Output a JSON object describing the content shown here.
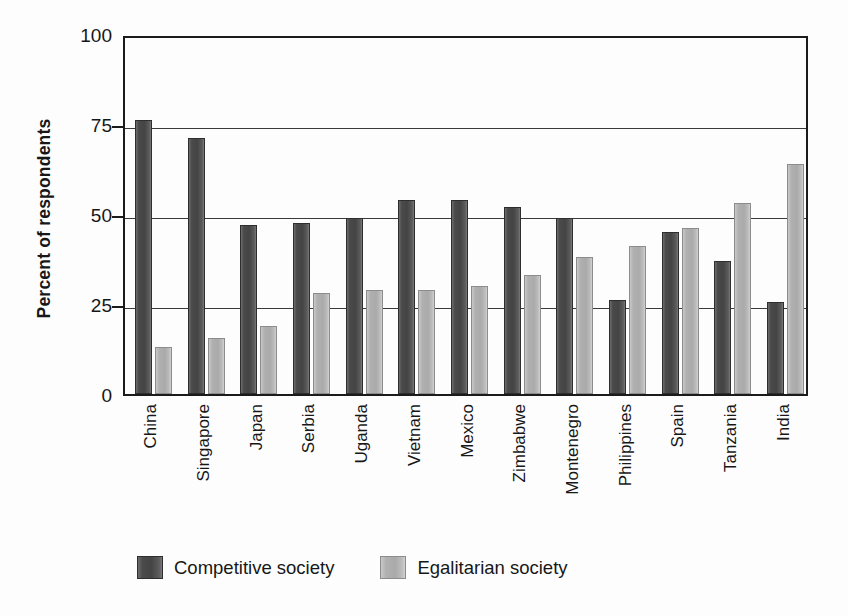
{
  "chart_data": {
    "type": "bar",
    "title": "",
    "xlabel": "",
    "ylabel": "Percent of respondents",
    "ylim": [
      0,
      100
    ],
    "yticks": [
      0,
      25,
      50,
      75,
      100
    ],
    "ytick_labels": [
      "0",
      "25",
      "50",
      "75",
      "100"
    ],
    "grid": "horizontal",
    "legend_position": "bottom",
    "categories": [
      "China",
      "Singapore",
      "Japan",
      "Serbia",
      "Uganda",
      "Vietnam",
      "Mexico",
      "Zimbabwe",
      "Montenegro",
      "Philippines",
      "Spain",
      "Tanzania",
      "India"
    ],
    "series": [
      {
        "name": "Competitive society",
        "color": "#4a4a4a",
        "values": [
          76,
          71,
          47,
          47.5,
          49,
          54,
          54,
          52,
          49,
          26,
          45,
          37,
          25.5
        ]
      },
      {
        "name": "Egalitarian society",
        "color": "#b0b0b0",
        "values": [
          13,
          15.5,
          19,
          28,
          29,
          29,
          30,
          33,
          38,
          41,
          46,
          53,
          64
        ]
      }
    ]
  },
  "legend": {
    "items": [
      {
        "label": "Competitive society",
        "swatch": "dark"
      },
      {
        "label": "Egalitarian society",
        "swatch": "light"
      }
    ]
  }
}
